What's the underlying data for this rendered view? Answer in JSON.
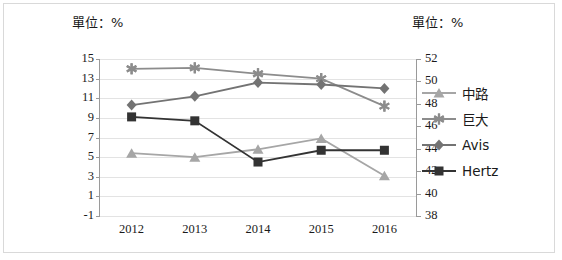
{
  "axis_unit_left": "單位：%",
  "axis_unit_right": "單位：%",
  "legend": [
    {
      "label": "中路",
      "marker": "triangle",
      "color": "#a6a6a6"
    },
    {
      "label": "巨大",
      "marker": "asterisk",
      "color": "#8c8c8c"
    },
    {
      "label": "Avis",
      "marker": "diamond",
      "color": "#737373"
    },
    {
      "label": "Hertz",
      "marker": "square",
      "color": "#333333"
    }
  ],
  "chart_data": {
    "type": "line",
    "title": "",
    "xlabel": "",
    "ylabel": "",
    "grid": true,
    "legend_position": "right",
    "categories": [
      "2012",
      "2013",
      "2014",
      "2015",
      "2016"
    ],
    "axes": {
      "left": {
        "ticks": [
          15,
          13,
          11,
          9,
          7,
          5,
          3,
          1,
          -1
        ],
        "ylim": [
          -1,
          15
        ],
        "unit": "單位：%"
      },
      "right": {
        "ticks": [
          52,
          50,
          48,
          46,
          44,
          42,
          40,
          38
        ],
        "ylim": [
          38,
          52
        ],
        "unit": "單位：%"
      }
    },
    "series": [
      {
        "name": "中路",
        "axis": "left",
        "marker": "triangle",
        "color": "#a6a6a6",
        "values": [
          5.4,
          5.0,
          5.8,
          6.9,
          3.1
        ]
      },
      {
        "name": "巨大",
        "axis": "left",
        "marker": "asterisk",
        "color": "#8c8c8c",
        "values": [
          14.0,
          14.1,
          13.5,
          13.0,
          10.2
        ]
      },
      {
        "name": "Avis",
        "axis": "left",
        "marker": "diamond",
        "color": "#737373",
        "values": [
          10.3,
          11.2,
          12.6,
          12.4,
          12.0
        ]
      },
      {
        "name": "Hertz",
        "axis": "left",
        "marker": "square",
        "color": "#333333",
        "values": [
          9.1,
          8.7,
          4.5,
          5.7,
          5.7
        ]
      }
    ]
  }
}
